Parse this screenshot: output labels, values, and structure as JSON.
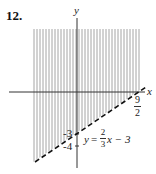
{
  "problem": {
    "number": "12."
  },
  "chart_data": {
    "type": "line",
    "title": "",
    "xlabel": "x",
    "ylabel": "y",
    "series": [
      {
        "name": "boundary",
        "equation": "y = (2/3)x - 3",
        "style": "dashed",
        "x": [
          -4.5,
          4.5
        ],
        "y": [
          -6,
          0
        ]
      }
    ],
    "shaded_region": "y >= (2/3)x - 3 (above dashed line, vertical hatching)",
    "annotations": {
      "y_intercept": "-3",
      "extra_tick": "-4",
      "x_intercept": {
        "numerator": "9",
        "denominator": "2"
      },
      "equation_label": {
        "lhs": "y",
        "eq": "=",
        "num": "2",
        "den": "3",
        "rhs": "x − 3"
      }
    },
    "grid": false,
    "legend": "none"
  },
  "axes": {
    "x_label": "x",
    "y_label": "y"
  },
  "colors": {
    "axis": "#333333",
    "hatch": "#9a9a9a",
    "boundary": "#111111"
  }
}
